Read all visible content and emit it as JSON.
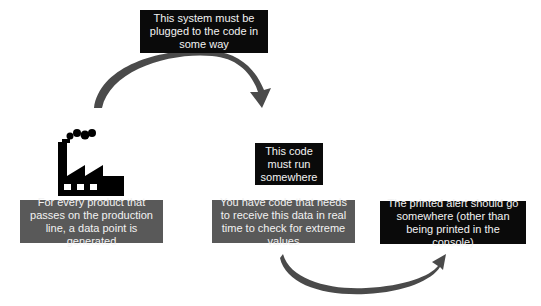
{
  "diagram": {
    "top_note": "This system must be plugged to the code in some way",
    "source": {
      "icon": "factory-icon",
      "label": "For every product that passes on the production line, a data point is generated"
    },
    "run_note": "This code must run somewhere",
    "processor": {
      "label": "You have code that needs to receive this data in real time to check for extreme values"
    },
    "output_note": "The printed alert should go somewhere (other than being printed in the console)",
    "colors": {
      "dark_box": "#0a0a0a",
      "gray_box": "#595959",
      "arrow": "#4a4a4a",
      "text": "#f2f2f2"
    }
  }
}
